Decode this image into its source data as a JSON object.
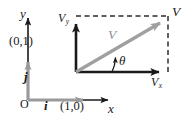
{
  "figure": {
    "type": "vector-diagram",
    "width": 193,
    "height": 123,
    "background": "#ffffff",
    "colors": {
      "axis": "#1a1a1a",
      "unit_vector": "#9a9a9a",
      "resultant_vector": "#a0a0a0",
      "dashed": "#2b2b2b",
      "text": "#1a1a1a",
      "text_gray": "#8d8d8d"
    }
  },
  "left_axes": {
    "name": "unit-vector-coordinate-system",
    "origin_label": "O",
    "y_axis_label": "y",
    "x_axis_label": "x",
    "unit_vector_j": "j",
    "unit_vector_i": "i",
    "point_0_1": "(0,1)",
    "point_1_0": "(1,0)"
  },
  "right_axes": {
    "name": "component-rectangle",
    "vertical_component_label": "V",
    "vertical_component_sub": "y",
    "horizontal_component_label": "V",
    "horizontal_component_sub": "x",
    "vector_tip_label": "V",
    "vector_body_label": "V",
    "angle_label": "θ"
  },
  "geometry": {
    "left_origin": [
      28,
      100
    ],
    "left_y_axis_top": [
      28,
      14
    ],
    "left_x_axis_right": [
      113,
      100
    ],
    "unit_j_tip": [
      28,
      58
    ],
    "unit_i_tip": [
      88,
      100
    ],
    "rect_origin": [
      76,
      72
    ],
    "rect_top_left": [
      76,
      16
    ],
    "rect_top_right": [
      168,
      16
    ],
    "rect_bottom_right": [
      168,
      72
    ],
    "vy_arrow_tip": [
      76,
      19
    ],
    "vx_arrow_tip": [
      166,
      72
    ],
    "resultant_tip": [
      166,
      19
    ],
    "angle_deg": 31
  }
}
